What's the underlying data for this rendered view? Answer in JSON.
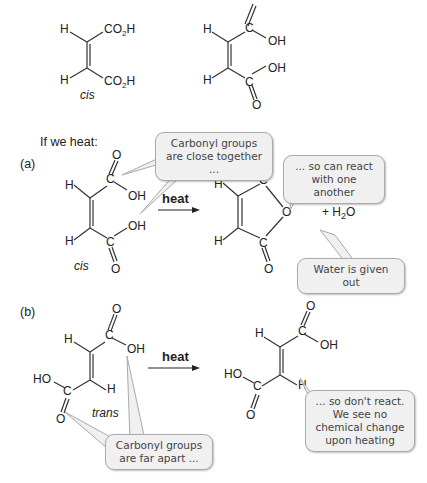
{
  "top": {
    "cis_label": "cis",
    "groups": [
      "CO2H",
      "CO2H"
    ],
    "H": "H",
    "O": "O",
    "OH": "OH",
    "C": "C"
  },
  "intro": "If we heat:",
  "section_a": {
    "label": "(a)",
    "isomer": "cis",
    "arrow_label": "heat",
    "plus_water": "+ H2O",
    "bubbles": {
      "close": "Carbonyl groups are close together ...",
      "react": "... so can react with one another",
      "water": "Water is given out"
    }
  },
  "section_b": {
    "label": "(b)",
    "isomer": "trans",
    "arrow_label": "heat",
    "HO": "HO",
    "bubbles": {
      "far": "Carbonyl groups are far apart ...",
      "noreact": "... so don't react. We see no chemical change upon heating"
    }
  }
}
